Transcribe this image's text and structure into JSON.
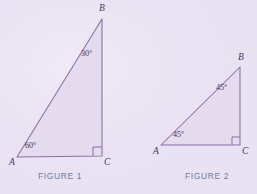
{
  "page": {
    "background_color": "#ece6f4",
    "width": 257,
    "height": 194
  },
  "style": {
    "stroke_color": "#8a6ea8",
    "fill_color": "#e4dbee",
    "vertex_label_color": "#4a3a63",
    "angle_label_color": "#40305a",
    "caption_color": "#6e7c9c"
  },
  "figures": [
    {
      "id": "figure-1",
      "caption": "FIGURE 1",
      "caption_pos": {
        "x": 60,
        "y": 172
      },
      "triangle": {
        "A": {
          "x": 17,
          "y": 157
        },
        "B": {
          "x": 102,
          "y": 19
        },
        "C": {
          "x": 102,
          "y": 156
        }
      },
      "vertices": [
        {
          "name": "A",
          "label": "A",
          "x": 9,
          "y": 158
        },
        {
          "name": "B",
          "label": "B",
          "x": 99,
          "y": 4
        },
        {
          "name": "C",
          "label": "C",
          "x": 104,
          "y": 158
        }
      ],
      "angles": [
        {
          "at": "A",
          "label": "60°",
          "x": 25,
          "y": 142
        },
        {
          "at": "B",
          "label": "30°",
          "x": 81,
          "y": 50
        },
        {
          "at": "C",
          "label": "right-angle-marker",
          "marker": true,
          "size": 9
        }
      ]
    },
    {
      "id": "figure-2",
      "caption": "FIGURE 2",
      "caption_pos": {
        "x": 207,
        "y": 172
      },
      "triangle": {
        "A": {
          "x": 161,
          "y": 145
        },
        "B": {
          "x": 240,
          "y": 67
        },
        "C": {
          "x": 240,
          "y": 145
        }
      },
      "vertices": [
        {
          "name": "A",
          "label": "A",
          "x": 153,
          "y": 147
        },
        {
          "name": "B",
          "label": "B",
          "x": 238,
          "y": 53
        },
        {
          "name": "C",
          "label": "C",
          "x": 242,
          "y": 147
        }
      ],
      "angles": [
        {
          "at": "A",
          "label": "45°",
          "x": 173,
          "y": 131
        },
        {
          "at": "B",
          "label": "45°",
          "x": 216,
          "y": 84
        },
        {
          "at": "C",
          "label": "right-angle-marker",
          "marker": true,
          "size": 8
        }
      ]
    }
  ]
}
